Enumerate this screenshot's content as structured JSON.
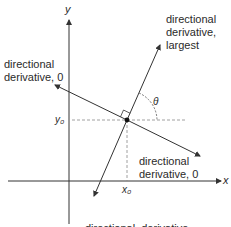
{
  "diagram": {
    "axes": {
      "x_label": "x",
      "y_label": "y",
      "x0_label": "x₀",
      "y0_label": "y₀"
    },
    "angle_label": "θ",
    "labels": {
      "largest_line1": "directional",
      "largest_line2": "derivative,",
      "largest_line3": "largest",
      "zero_left_line1": "directional",
      "zero_left_line2": "derivative, 0",
      "zero_right_line1": "directional",
      "zero_right_line2": "derivative, 0",
      "smallest_line1": "directional  derivative,",
      "smallest_line2": "smallest"
    },
    "colors": {
      "line": "#333333",
      "dashed": "#888888",
      "text": "#2a2a2a"
    }
  }
}
